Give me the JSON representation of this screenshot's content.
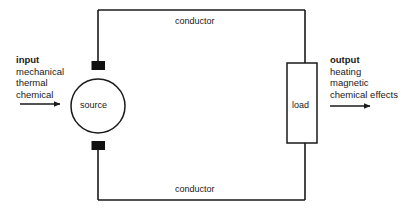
{
  "diagram": {
    "stroke_color": "#1a1a1a",
    "terminal_color": "#111111",
    "background_color": "#ffffff"
  },
  "input": {
    "heading": "input",
    "lines": [
      "mechanical",
      "thermal",
      "chemical"
    ],
    "arrow_name": "input-arrow"
  },
  "output": {
    "heading": "output",
    "lines": [
      "heating",
      "magnetic",
      "chemical effects"
    ],
    "arrow_name": "output-arrow"
  },
  "components": {
    "source_label": "source",
    "load_label": "load"
  },
  "wires": {
    "top_label": "conductor",
    "bottom_label": "conductor"
  }
}
